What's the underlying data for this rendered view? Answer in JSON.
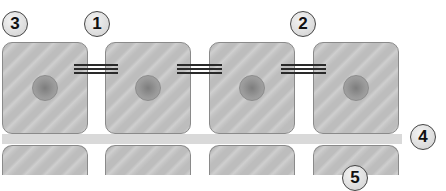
{
  "diagram": {
    "labels": [
      {
        "id": "label-3",
        "text": "3"
      },
      {
        "id": "label-1",
        "text": "1"
      },
      {
        "id": "label-2",
        "text": "2"
      },
      {
        "id": "label-4",
        "text": "4"
      },
      {
        "id": "label-5",
        "text": "5"
      }
    ],
    "colors": {
      "cell_fill": "#c4c4c4",
      "cell_border": "#8a8a8a",
      "nucleus": "#8c8c8c",
      "junction": "#2a2a2a",
      "membrane": "#d9d9d9"
    }
  }
}
